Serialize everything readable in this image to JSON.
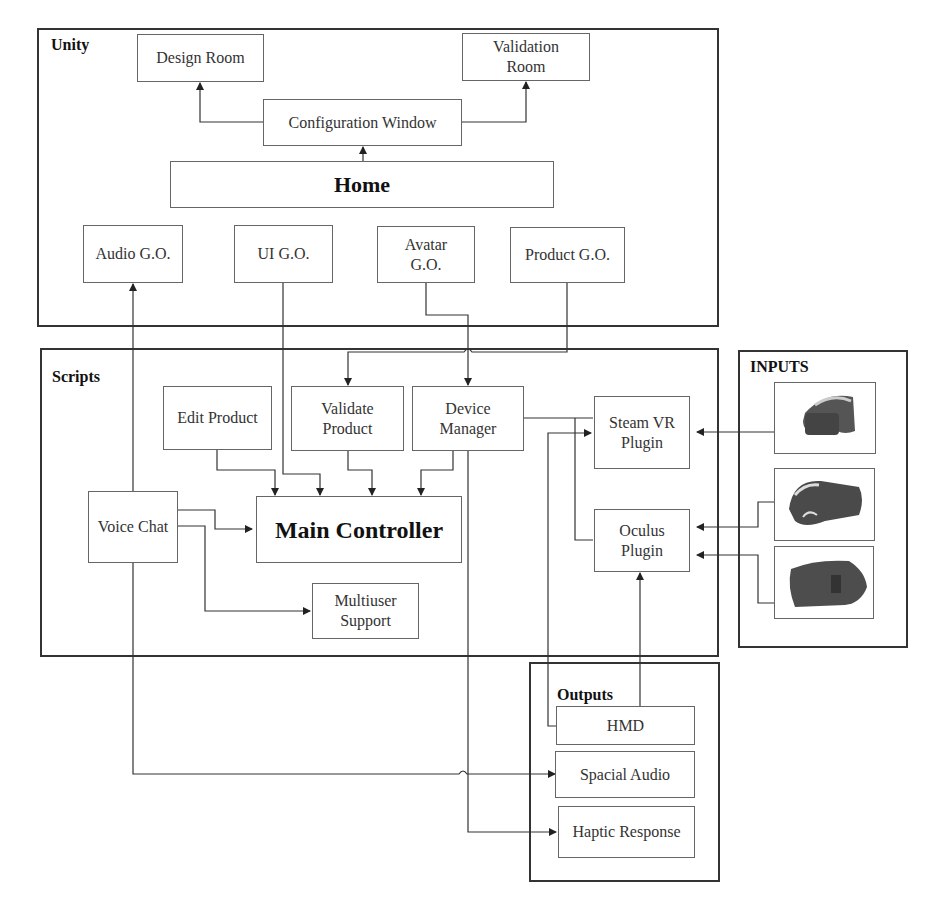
{
  "groups": {
    "unity": "Unity",
    "scripts": "Scripts",
    "inputs": "INPUTS",
    "outputs": "Outputs"
  },
  "unity_nodes": {
    "design_room": "Design Room",
    "validation_room": "Validation\nRoom",
    "configuration_window": "Configuration Window",
    "home": "Home",
    "audio_go": "Audio G.O.",
    "ui_go": "UI G.O.",
    "avatar_go": "Avatar\nG.O.",
    "product_go": "Product G.O."
  },
  "script_nodes": {
    "edit_product": "Edit Product",
    "validate_product": "Validate\nProduct",
    "device_manager": "Device\nManager",
    "steam_vr_plugin": "Steam VR\nPlugin",
    "oculus_plugin": "Oculus\nPlugin",
    "voice_chat": "Voice Chat",
    "main_controller": "Main Controller",
    "multiuser_support": "Multiuser\nSupport"
  },
  "input_devices": [
    {
      "name": "htc-vive-headset"
    },
    {
      "name": "oculus-rift-headset"
    },
    {
      "name": "oculus-headset"
    }
  ],
  "output_nodes": {
    "hmd": "HMD",
    "spacial_audio": "Spacial Audio",
    "haptic_response": "Haptic Response"
  },
  "colors": {
    "line": "#333333",
    "box_border": "#666666",
    "group_border": "#333333"
  }
}
